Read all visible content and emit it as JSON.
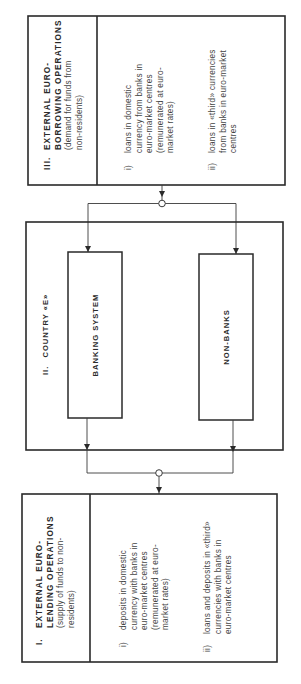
{
  "diagram": {
    "orientation": "rotated-90-ccw",
    "sections": {
      "borrowing": {
        "number": "III.",
        "title_lines": [
          "EXTERNAL  EURO-",
          "BORROWING  OPERATIONS"
        ],
        "subtitle_lines": [
          "(demand for funds from",
          "non-residents)"
        ],
        "items": [
          {
            "marker": "i)",
            "lines": [
              "loans in domestic",
              "currency from banks in",
              "euro-market centres",
              "(remunerated at euro-",
              "market rates)"
            ]
          },
          {
            "marker": "ii)",
            "lines": [
              "loans in «third» currencies",
              "from banks in euro-market",
              "centres"
            ]
          }
        ]
      },
      "country": {
        "number": "II.",
        "title": "COUNTRY  «E»",
        "blocks": [
          {
            "label": "BANKING  SYSTEM"
          },
          {
            "label": "NON-BANKS"
          }
        ]
      },
      "lending": {
        "number": "I.",
        "title_lines": [
          "EXTERNAL  EURO-",
          "LENDING  OPERATIONS"
        ],
        "subtitle_lines": [
          "(supply of funds to non-",
          "residents)"
        ],
        "items": [
          {
            "marker": "i)",
            "lines": [
              "deposits in domestic",
              "currency with banks in",
              "euro-market centres",
              "(remunerated at euro-",
              "market rates)"
            ]
          },
          {
            "marker": "ii)",
            "lines": [
              "loans and deposits in «third»",
              "currencies with banks in",
              "euro-market centres"
            ]
          }
        ]
      }
    },
    "colors": {
      "stroke": "#2a2a2a",
      "text": "#444444",
      "background": "#ffffff"
    }
  }
}
